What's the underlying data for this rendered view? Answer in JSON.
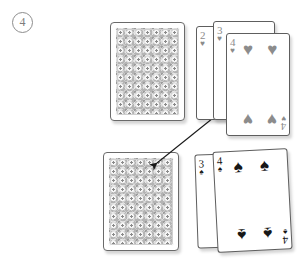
{
  "figure": {
    "step_number": "4",
    "step_label_name": "circled-step-number-4"
  },
  "colors": {
    "heart_pip": "#8c8c8c",
    "spade_pip": "#171717",
    "card_border": "#5e5e5e",
    "card_back_pattern": "#b4b4b4",
    "step_label": "#7d7d7d",
    "arrow": "#1a1a1a"
  },
  "cards": {
    "face_down_top": {
      "label": "face-down card back (upper)",
      "state": "face-down"
    },
    "face_down_bottom": {
      "label": "face-down card back (lower)",
      "state": "face-down"
    },
    "hearts_fan": [
      {
        "rank": "2",
        "suit": "♥",
        "suit_name": "hearts",
        "pip_count": 0,
        "visible": "index-only"
      },
      {
        "rank": "3",
        "suit": "♥",
        "suit_name": "hearts",
        "pip_count": 0,
        "visible": "index-only"
      },
      {
        "rank": "4",
        "suit": "♥",
        "suit_name": "hearts",
        "pip_count": 4,
        "visible": "full"
      }
    ],
    "spades_fan": [
      {
        "rank": "3",
        "suit": "♠",
        "suit_name": "spades",
        "pip_count": 0,
        "visible": "index-only"
      },
      {
        "rank": "4",
        "suit": "♠",
        "suit_name": "spades",
        "pip_count": 4,
        "visible": "full"
      }
    ]
  },
  "annotation": {
    "arrow_type": "double-headed",
    "arrow_from": "face-down card back (lower)",
    "arrow_to": "4 of hearts card"
  }
}
